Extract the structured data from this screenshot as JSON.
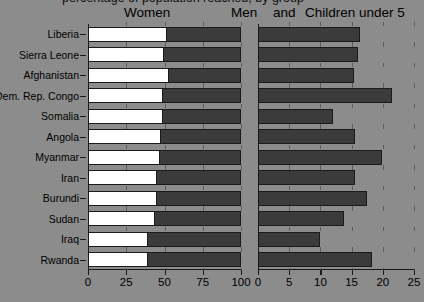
{
  "title_cut": "percentage of population reached, by group",
  "legend": {
    "women": "Women",
    "men": "Men",
    "and": "and",
    "children": "Children under 5"
  },
  "axes": {
    "left": {
      "ticks": [
        "0",
        "25",
        "50",
        "75",
        "100"
      ],
      "min": 0,
      "max": 100
    },
    "right": {
      "ticks": [
        "0",
        "5",
        "10",
        "15",
        "20",
        "25"
      ],
      "min": 0,
      "max": 25
    }
  },
  "colors": {
    "background": "#8c8c8c",
    "women": "#ffffff",
    "men": "#3b3b3b",
    "children": "#3b3b3b",
    "axis": "#1a1a1a"
  },
  "countries": [
    "Liberia",
    "Sierra Leone",
    "Afghanistan",
    "Dem. Rep. Congo",
    "Somalia",
    "Angola",
    "Myanmar",
    "Iran",
    "Burundi",
    "Sudan",
    "Iraq",
    "Rwanda"
  ],
  "chart_data": {
    "type": "bar",
    "title": "",
    "orientation": "horizontal",
    "panels": [
      {
        "name": "left",
        "xlabel": "",
        "ylabel": "",
        "xlim": [
          0,
          100
        ],
        "xticks": [
          0,
          25,
          50,
          75,
          100
        ],
        "stacked": true,
        "categories": [
          "Liberia",
          "Sierra Leone",
          "Afghanistan",
          "Dem. Rep. Congo",
          "Somalia",
          "Angola",
          "Myanmar",
          "Iran",
          "Burundi",
          "Sudan",
          "Iraq",
          "Rwanda"
        ],
        "series": [
          {
            "name": "Women",
            "values": [
              52,
              50,
              53,
              49,
              49,
              48,
              47,
              45,
              45,
              44,
              39,
              39
            ]
          },
          {
            "name": "Men",
            "values": [
              48,
              50,
              47,
              51,
              51,
              52,
              53,
              55,
              55,
              56,
              61,
              61
            ]
          }
        ]
      },
      {
        "name": "right",
        "xlabel": "",
        "ylabel": "",
        "xlim": [
          0,
          25
        ],
        "xticks": [
          0,
          5,
          10,
          15,
          20,
          25
        ],
        "stacked": false,
        "categories": [
          "Liberia",
          "Sierra Leone",
          "Afghanistan",
          "Dem. Rep. Congo",
          "Somalia",
          "Angola",
          "Myanmar",
          "Iran",
          "Burundi",
          "Sudan",
          "Iraq",
          "Rwanda"
        ],
        "series": [
          {
            "name": "Children under 5",
            "values": [
              16.3,
              16.0,
              15.4,
              21.4,
              12.0,
              15.5,
              19.8,
              15.6,
              17.5,
              13.8,
              10.0,
              18.2
            ]
          }
        ]
      }
    ],
    "grid": false,
    "legend_position": "top"
  }
}
